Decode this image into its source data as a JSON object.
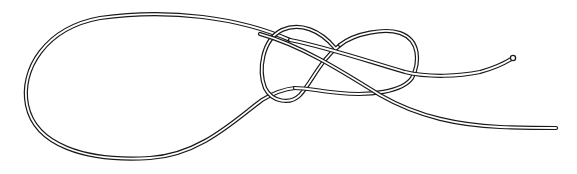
{
  "figure": {
    "description": "Line drawing of a rope tied in a loop knot (figure-eight style) with a large loop on the left and two tails extending to the right",
    "colors": {
      "background": "#ffffff",
      "rope_outline": "#1a1a1a",
      "rope_fill": "#ffffff"
    },
    "parts": [
      "large-loop",
      "knot-left-lobe",
      "knot-right-lobe",
      "upper-tail",
      "lower-tail"
    ]
  }
}
